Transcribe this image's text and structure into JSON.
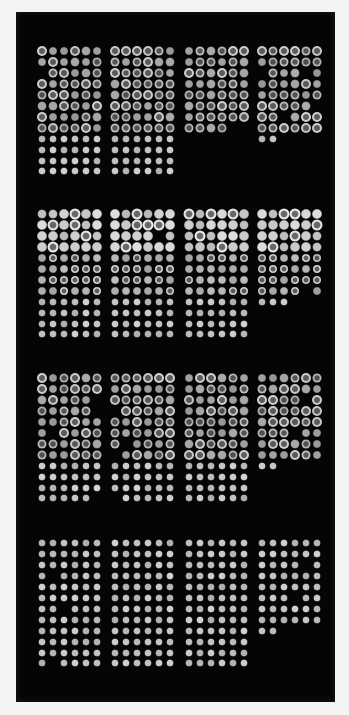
{
  "image": {
    "description": "Microarray slide scan: 16 blocks (4 rows x 4 columns) of fluorescent spots on dark background",
    "background_color": "#050505",
    "border_color": "#f4f4f4",
    "spot_color_base": "#c8c8c8"
  },
  "layout": {
    "block_cols_x": [
      42,
      115,
      189,
      262
    ],
    "block_rows_y": [
      51,
      214,
      378,
      543
    ],
    "spot_pitch_x": 11,
    "spot_pitch_y": 10.95,
    "spots_per_row": 6,
    "rows_per_block": 12
  },
  "blocks": [
    {
      "id": 1,
      "mask": [
        "111111",
        "111111",
        "011111",
        "111111",
        "111111",
        "111111",
        "111111",
        "111111",
        "111111",
        "111111",
        "111111",
        "111111"
      ],
      "style": "ring-top"
    },
    {
      "id": 2,
      "mask": [
        "111111",
        "111111",
        "111111",
        "111111",
        "111111",
        "111111",
        "111111",
        "111111",
        "111111",
        "111111",
        "111111",
        "111111"
      ],
      "style": "ring-top"
    },
    {
      "id": 3,
      "mask": [
        "111111",
        "111111",
        "111111",
        "111111",
        "111111",
        "111111",
        "111111",
        "111100",
        "000000",
        "000000",
        "000000",
        "000000"
      ],
      "style": "ring-top"
    },
    {
      "id": 4,
      "mask": [
        "111111",
        "111111",
        "011101",
        "111111",
        "111111",
        "111110",
        "110111",
        "111111",
        "110000",
        "000000",
        "000000",
        "000000"
      ],
      "style": "ring-top"
    },
    {
      "id": 5,
      "mask": [
        "111111",
        "111111",
        "111111",
        "111111",
        "111111",
        "111111",
        "111111",
        "111111",
        "111111",
        "111111",
        "111111",
        "111111"
      ],
      "style": "bright-top"
    },
    {
      "id": 6,
      "mask": [
        "111111",
        "111111",
        "111101",
        "111111",
        "111111",
        "111111",
        "111111",
        "111111",
        "111111",
        "111111",
        "111111",
        "111111"
      ],
      "style": "bright-top"
    },
    {
      "id": 7,
      "mask": [
        "111111",
        "111111",
        "111111",
        "111111",
        "111111",
        "111111",
        "111111",
        "111111",
        "111111",
        "111111",
        "111111",
        "111111"
      ],
      "style": "bright-top"
    },
    {
      "id": 8,
      "mask": [
        "111111",
        "111111",
        "111111",
        "111111",
        "111111",
        "111111",
        "111111",
        "111101",
        "111000",
        "000000",
        "000000",
        "000000"
      ],
      "style": "bright-top"
    },
    {
      "id": 9,
      "mask": [
        "111111",
        "111111",
        "111110",
        "111110",
        "111111",
        "101111",
        "111111",
        "111111",
        "111111",
        "111111",
        "111111",
        "111110"
      ],
      "style": "ring-top"
    },
    {
      "id": 10,
      "mask": [
        "111111",
        "111111",
        "111111",
        "011111",
        "111111",
        "111111",
        "101111",
        "011111",
        "111111",
        "111111",
        "111111",
        "011111"
      ],
      "style": "ring-top"
    },
    {
      "id": 11,
      "mask": [
        "111111",
        "111111",
        "111111",
        "111111",
        "111111",
        "111111",
        "111111",
        "111111",
        "111111",
        "111111",
        "111111",
        "111111"
      ],
      "style": "ring-top"
    },
    {
      "id": 12,
      "mask": [
        "111111",
        "111111",
        "111101",
        "111111",
        "111111",
        "111011",
        "111111",
        "111111",
        "110000",
        "000000",
        "000000",
        "000000"
      ],
      "style": "ring-top"
    },
    {
      "id": 13,
      "mask": [
        "111111",
        "111111",
        "111111",
        "101111",
        "111111",
        "111111",
        "110111",
        "111111",
        "111111",
        "111111",
        "111111",
        "101111"
      ],
      "style": "solid"
    },
    {
      "id": 14,
      "mask": [
        "111111",
        "111111",
        "111111",
        "111111",
        "111111",
        "111111",
        "111111",
        "111111",
        "111111",
        "111111",
        "111111",
        "111111"
      ],
      "style": "solid"
    },
    {
      "id": 15,
      "mask": [
        "111111",
        "111111",
        "111111",
        "111111",
        "111111",
        "111111",
        "111111",
        "111111",
        "111111",
        "111111",
        "111111",
        "111111"
      ],
      "style": "solid"
    },
    {
      "id": 16,
      "mask": [
        "111111",
        "111111",
        "111101",
        "111111",
        "111111",
        "111011",
        "111111",
        "111111",
        "110000",
        "000000",
        "000000",
        "000000"
      ],
      "style": "solid"
    }
  ]
}
